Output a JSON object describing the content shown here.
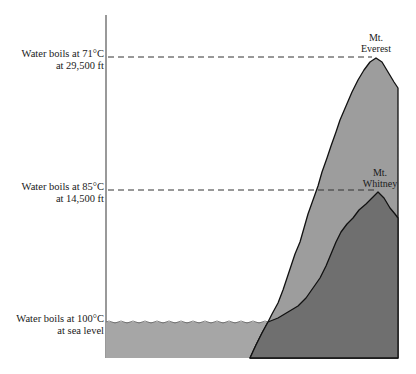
{
  "diagram": {
    "levels": [
      {
        "line1": "Water boils at 71°C",
        "line2": "at 29,500 ft",
        "y": 57
      },
      {
        "line1": "Water boils at 85°C",
        "line2": "at 14,500 ft",
        "y": 190
      },
      {
        "line1": "Water boils at 100°C",
        "line2": "at sea level",
        "y": 322
      }
    ],
    "peaks": [
      {
        "line1": "Mt.",
        "line2": "Everest",
        "altitude_ft": 29500,
        "boiling_point_c": 71
      },
      {
        "line1": "Mt.",
        "line2": "Whitney",
        "altitude_ft": 14500,
        "boiling_point_c": 85
      }
    ],
    "colors": {
      "water": "#a4a4a4",
      "everest": "#9c9c9c",
      "whitney": "#6e6e6e",
      "outline": "#111111",
      "axis": "#555555",
      "dash": "#333333"
    }
  }
}
